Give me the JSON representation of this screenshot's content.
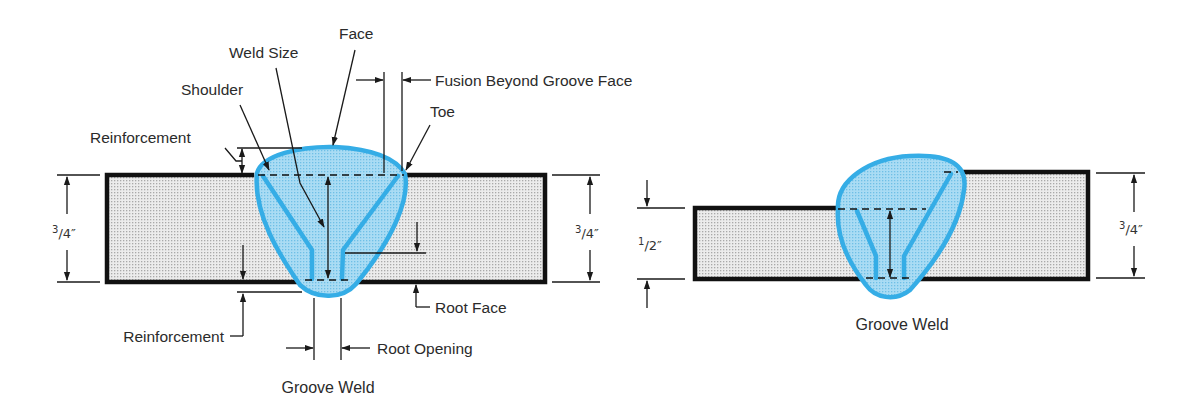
{
  "colors": {
    "weld_outline": "#35ade6",
    "weld_fill": "#a9dcf4",
    "plate_fill": "#e6e6e6",
    "plate_edge": "#111111",
    "text": "#2b2b2b"
  },
  "figures": {
    "left": {
      "caption": "Groove Weld",
      "labels": {
        "face": "Face",
        "weld_size": "Weld Size",
        "shoulder": "Shoulder",
        "reinforcement_top": "Reinforcement",
        "fusion": "Fusion Beyond Groove Face",
        "toe": "Toe",
        "root_face": "Root Face",
        "reinforcement_bottom": "Reinforcement",
        "root_opening": "Root Opening"
      },
      "dims": {
        "left_thickness": {
          "num": "3",
          "sep": "/",
          "den": "4",
          "unit": "″"
        },
        "right_thickness": {
          "num": "3",
          "sep": "/",
          "den": "4",
          "unit": "″"
        }
      }
    },
    "right": {
      "caption": "Groove Weld",
      "dims": {
        "left_thickness": {
          "num": "1",
          "sep": "/",
          "den": "2",
          "unit": "″"
        },
        "right_thickness": {
          "num": "3",
          "sep": "/",
          "den": "4",
          "unit": "″"
        }
      }
    }
  }
}
